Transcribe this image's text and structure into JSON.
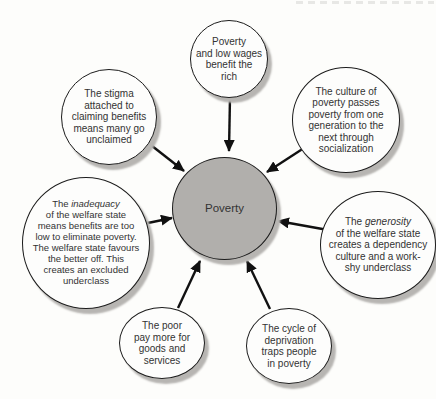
{
  "diagram": {
    "center": {
      "label": "Poverty"
    },
    "nodes": {
      "top": {
        "text": "Poverty\nand low wages\nbenefit the\nrich"
      },
      "top_left": {
        "text": "The stigma\nattached to\nclaiming benefits\nmeans many go\nunclaimed"
      },
      "top_right": {
        "text": "The culture of\npoverty passes\npoverty from one\ngeneration to the\nnext through\nsocialization"
      },
      "left": {
        "pre": "The ",
        "italic": "inadequacy",
        "post": "\nof the welfare state\nmeans benefits are too\nlow to eliminate poverty.\nThe welfare state favours\nthe better off. This\ncreates an excluded\nunderclass"
      },
      "right": {
        "pre": "The ",
        "italic": "generosity",
        "post": "\nof the welfare state\ncreates a dependency\nculture and a work-\nshy underclass"
      },
      "bottom_left": {
        "text": "The poor\npay more for\ngoods and\nservices"
      },
      "bottom_right": {
        "text": "The cycle of\ndeprivation\ntraps people\nin poverty"
      }
    },
    "colors": {
      "background": "#fdfdfb",
      "bubble_fill": "#fdfdfc",
      "center_fill": "#b1afac",
      "outline": "#1c1c1c",
      "shadow": "#b7b5b2",
      "text": "#333333",
      "arrow": "#111111"
    }
  }
}
